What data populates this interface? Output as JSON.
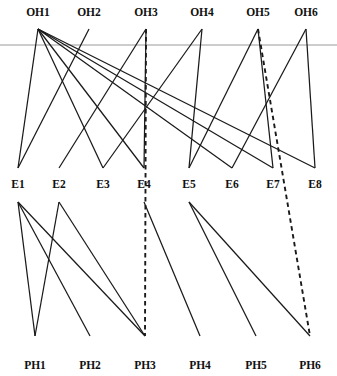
{
  "diagram": {
    "colors": {
      "background": "#ffffff",
      "edge": "#1a1a1a",
      "guide": "#9a9a9a",
      "label": "#111111"
    },
    "layers": [
      {
        "id": "OH",
        "name": "top-layer",
        "label_y": 16,
        "node_y": 29,
        "nodes": [
          {
            "id": "OH1",
            "label": "OH1",
            "x": 38
          },
          {
            "id": "OH2",
            "label": "OH2",
            "x": 89
          },
          {
            "id": "OH3",
            "label": "OH3",
            "x": 146
          },
          {
            "id": "OH4",
            "label": "OH4",
            "x": 202
          },
          {
            "id": "OH5",
            "label": "OH5",
            "x": 258
          },
          {
            "id": "OH6",
            "label": "OH6",
            "x": 306
          }
        ]
      },
      {
        "id": "E",
        "name": "middle-layer",
        "label_y": 188,
        "node_y": 168,
        "node_y_bottom": 202,
        "nodes": [
          {
            "id": "E1",
            "label": "E1",
            "x": 18
          },
          {
            "id": "E2",
            "label": "E2",
            "x": 59
          },
          {
            "id": "E3",
            "label": "E3",
            "x": 103
          },
          {
            "id": "E4",
            "label": "E4",
            "x": 144
          },
          {
            "id": "E5",
            "label": "E5",
            "x": 189
          },
          {
            "id": "E6",
            "label": "E6",
            "x": 232
          },
          {
            "id": "E7",
            "label": "E7",
            "x": 273
          },
          {
            "id": "E8",
            "label": "E8",
            "x": 315
          }
        ]
      },
      {
        "id": "PH",
        "name": "bottom-layer",
        "label_y": 369,
        "node_y": 336,
        "nodes": [
          {
            "id": "PH1",
            "label": "PH1",
            "x": 35
          },
          {
            "id": "PH2",
            "label": "PH2",
            "x": 90
          },
          {
            "id": "PH3",
            "label": "PH3",
            "x": 145
          },
          {
            "id": "PH4",
            "label": "PH4",
            "x": 200
          },
          {
            "id": "PH5",
            "label": "PH5",
            "x": 256
          },
          {
            "id": "PH6",
            "label": "PH6",
            "x": 310
          }
        ]
      }
    ],
    "guide": {
      "y": 45,
      "x1": 0,
      "x2": 337
    },
    "edges_top": [
      {
        "from": "OH1",
        "to": "E1",
        "style": "solid"
      },
      {
        "from": "OH1",
        "to": "E3",
        "style": "solid"
      },
      {
        "from": "OH1",
        "to": "E4",
        "style": "solid"
      },
      {
        "from": "OH1",
        "to": "E6",
        "style": "solid"
      },
      {
        "from": "OH1",
        "to": "E7",
        "style": "solid"
      },
      {
        "from": "OH1",
        "to": "E8",
        "style": "solid"
      },
      {
        "from": "OH2",
        "to": "E1",
        "style": "solid"
      },
      {
        "from": "OH3",
        "to": "E2",
        "style": "solid"
      },
      {
        "from": "OH3",
        "to": "E4",
        "style": "solid"
      },
      {
        "from": "OH3",
        "to": "PH3",
        "style": "dashed"
      },
      {
        "from": "OH4",
        "to": "E3",
        "style": "solid"
      },
      {
        "from": "OH4",
        "to": "E5",
        "style": "solid"
      },
      {
        "from": "OH5",
        "to": "E5",
        "style": "solid"
      },
      {
        "from": "OH5",
        "to": "E7",
        "style": "solid"
      },
      {
        "from": "OH5",
        "to": "PH6",
        "style": "dashed"
      },
      {
        "from": "OH6",
        "to": "E6",
        "style": "solid"
      },
      {
        "from": "OH6",
        "to": "E8",
        "style": "solid"
      }
    ],
    "edges_bottom": [
      {
        "from": "E1",
        "to": "PH1",
        "style": "solid"
      },
      {
        "from": "E1",
        "to": "PH2",
        "style": "solid"
      },
      {
        "from": "E1",
        "to": "PH3",
        "style": "solid"
      },
      {
        "from": "E2",
        "to": "PH1",
        "style": "solid"
      },
      {
        "from": "E2",
        "to": "PH3",
        "style": "solid"
      },
      {
        "from": "E5",
        "to": "PH5",
        "style": "solid"
      },
      {
        "from": "E5",
        "to": "PH6",
        "style": "solid"
      },
      {
        "from": "E4",
        "to": "PH4",
        "style": "solid"
      }
    ]
  }
}
